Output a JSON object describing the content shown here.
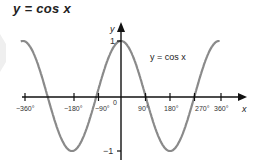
{
  "title": "y = cos x",
  "chart_data": {
    "type": "line",
    "title": "y = cos x",
    "xlabel": "x",
    "ylabel": "y",
    "series": [
      {
        "name": "y = cos x",
        "function": "cos(x)",
        "x_range_deg": [
          -360,
          360
        ]
      }
    ],
    "x_ticks": [
      "-360°",
      "-180°",
      "-90°",
      "0",
      "90°",
      "180°",
      "270°",
      "360°"
    ],
    "y_ticks": [
      "1",
      "-1"
    ],
    "xlim": [
      -400,
      450
    ],
    "ylim": [
      -1.1,
      1.3
    ],
    "grid": false,
    "legend": "inline label near curve"
  },
  "labels": {
    "y_axis": "y",
    "x_axis": "x",
    "curve": "y = cos x",
    "y_one": "1",
    "y_minus_one": "−1",
    "x_neg360": "−360°",
    "x_neg180": "−180°",
    "x_neg90": "−90°",
    "x_zero": "0",
    "x_90": "90°",
    "x_180": "180°",
    "x_270": "270°",
    "x_360": "360°"
  },
  "colors": {
    "curve": "#888888",
    "axis": "#111111"
  }
}
